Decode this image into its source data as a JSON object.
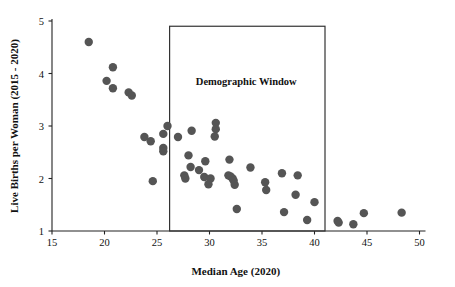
{
  "chart_data": {
    "type": "scatter",
    "title": "",
    "xlabel": "Median Age (2020)",
    "ylabel": "Live Births per Woman (2015 - 2020)",
    "xlim": [
      15,
      50
    ],
    "ylim": [
      1,
      5
    ],
    "xticks": [
      15,
      20,
      25,
      30,
      35,
      40,
      45,
      50
    ],
    "yticks": [
      1,
      2,
      3,
      4,
      5
    ],
    "xticklabels": [
      "15",
      "20",
      "25",
      "30",
      "35",
      "40",
      "45",
      "50"
    ],
    "yticklabels": [
      "1",
      "2",
      "3",
      "4",
      "5"
    ],
    "grid": false,
    "legend": null,
    "marker_color": "#555555",
    "marker_size": 4.2,
    "axis_color": "#222222",
    "annotations": [
      {
        "name": "demographic-window",
        "label": "Demographic Window",
        "shape": "rect",
        "x_range": [
          26.2,
          41.0
        ],
        "y_range": [
          1.0,
          4.9
        ],
        "label_x": 33.5,
        "label_y": 3.78,
        "stroke": "#333333",
        "fill": "none"
      }
    ],
    "points": [
      {
        "x": 18.5,
        "y": 4.6
      },
      {
        "x": 20.8,
        "y": 4.12
      },
      {
        "x": 20.2,
        "y": 3.86
      },
      {
        "x": 20.8,
        "y": 3.72
      },
      {
        "x": 22.3,
        "y": 3.64
      },
      {
        "x": 22.6,
        "y": 3.58
      },
      {
        "x": 26.0,
        "y": 3.0
      },
      {
        "x": 30.6,
        "y": 3.06
      },
      {
        "x": 30.6,
        "y": 2.94
      },
      {
        "x": 28.3,
        "y": 2.91
      },
      {
        "x": 25.6,
        "y": 2.85
      },
      {
        "x": 30.5,
        "y": 2.8
      },
      {
        "x": 23.8,
        "y": 2.79
      },
      {
        "x": 27.0,
        "y": 2.79
      },
      {
        "x": 24.4,
        "y": 2.71
      },
      {
        "x": 25.6,
        "y": 2.58
      },
      {
        "x": 25.6,
        "y": 2.52
      },
      {
        "x": 28.0,
        "y": 2.44
      },
      {
        "x": 31.9,
        "y": 2.36
      },
      {
        "x": 29.6,
        "y": 2.33
      },
      {
        "x": 28.2,
        "y": 2.22
      },
      {
        "x": 33.9,
        "y": 2.21
      },
      {
        "x": 29.0,
        "y": 2.16
      },
      {
        "x": 36.9,
        "y": 2.1
      },
      {
        "x": 38.4,
        "y": 2.06
      },
      {
        "x": 31.8,
        "y": 2.06
      },
      {
        "x": 32.0,
        "y": 2.04
      },
      {
        "x": 32.2,
        "y": 2.0
      },
      {
        "x": 32.3,
        "y": 1.96
      },
      {
        "x": 27.6,
        "y": 2.06
      },
      {
        "x": 29.5,
        "y": 2.03
      },
      {
        "x": 27.7,
        "y": 2.0
      },
      {
        "x": 30.1,
        "y": 2.0
      },
      {
        "x": 24.6,
        "y": 1.95
      },
      {
        "x": 35.3,
        "y": 1.93
      },
      {
        "x": 29.9,
        "y": 1.89
      },
      {
        "x": 32.4,
        "y": 1.88
      },
      {
        "x": 35.4,
        "y": 1.78
      },
      {
        "x": 38.2,
        "y": 1.69
      },
      {
        "x": 40.0,
        "y": 1.55
      },
      {
        "x": 32.6,
        "y": 1.42
      },
      {
        "x": 37.1,
        "y": 1.36
      },
      {
        "x": 44.7,
        "y": 1.34
      },
      {
        "x": 48.3,
        "y": 1.35
      },
      {
        "x": 39.3,
        "y": 1.21
      },
      {
        "x": 42.2,
        "y": 1.19
      },
      {
        "x": 42.3,
        "y": 1.16
      },
      {
        "x": 43.7,
        "y": 1.13
      }
    ]
  }
}
